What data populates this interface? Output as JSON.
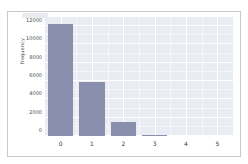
{
  "figure": {
    "background_color": "#ffffff",
    "border_color": "#c9c9c9"
  },
  "chart_data": {
    "type": "bar",
    "title": "",
    "subtitle": "",
    "xlabel": "",
    "ylabel": "frequency",
    "categories": [
      "0",
      "1",
      "2",
      "3",
      "4",
      "5"
    ],
    "values": [
      12200,
      5950,
      1500,
      150,
      0,
      0
    ],
    "series": [
      {
        "name": "frequency",
        "values": [
          12200,
          5950,
          1500,
          150,
          0,
          0
        ],
        "color": "#8b8fae"
      }
    ],
    "xlim": [
      -0.5,
      5.5
    ],
    "ylim": [
      0,
      13000
    ],
    "xticks": [
      "0",
      "1",
      "2",
      "3",
      "4",
      "5"
    ],
    "xtick_values": [
      0,
      1,
      2,
      3,
      4,
      5
    ],
    "yticks": [
      "0",
      "2000",
      "4000",
      "6000",
      "8000",
      "10000",
      "12000"
    ],
    "ytick_values": [
      0,
      2000,
      4000,
      6000,
      8000,
      10000,
      12000
    ],
    "grid": true,
    "grid_color": "#ffffff",
    "minor_grid": true,
    "legend": false,
    "legend_position": "none",
    "axes_background": "#e9ecf2",
    "bar_width": 0.8,
    "style": "seaborn-darkgrid"
  }
}
